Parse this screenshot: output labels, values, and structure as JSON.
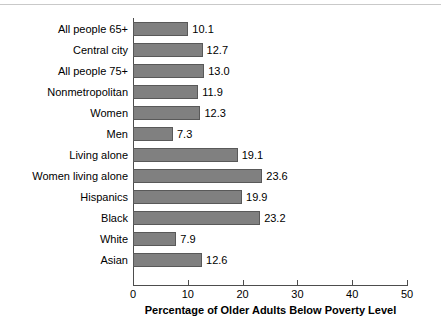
{
  "chart_data": {
    "type": "bar",
    "orientation": "horizontal",
    "title": "",
    "xlabel": "Percentage of Older Adults Below Poverty Level",
    "ylabel": "",
    "xlim": [
      0,
      50
    ],
    "xticks": [
      "0",
      "10",
      "20",
      "30",
      "40",
      "50"
    ],
    "grid": false,
    "legend": null,
    "bar_color": "#808080",
    "bar_edge_color": "#595959",
    "categories": [
      "All people 65+",
      "Central city",
      "All people 75+",
      "Nonmetropolitan",
      "Women",
      "Men",
      "Living alone",
      "Women living alone",
      "Hispanics",
      "Black",
      "White",
      "Asian"
    ],
    "values": [
      10.1,
      12.7,
      13.0,
      11.9,
      12.3,
      7.3,
      19.1,
      23.6,
      19.9,
      23.2,
      7.9,
      12.6
    ],
    "value_labels": [
      "10.1",
      "12.7",
      "13.0",
      "11.9",
      "12.3",
      "7.3",
      "19.1",
      "23.6",
      "19.9",
      "23.2",
      "7.9",
      "12.6"
    ]
  }
}
